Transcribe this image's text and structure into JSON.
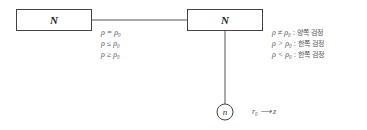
{
  "diagram": {
    "nodes": {
      "left_box": {
        "label": "N"
      },
      "right_box": {
        "label": "N"
      },
      "sample_circle": {
        "label": "n"
      }
    },
    "left_conditions": [
      {
        "text": "ρ = ρ₀"
      },
      {
        "text": "ρ ≤ ρ₀"
      },
      {
        "text": "ρ ≥ ρ₀"
      }
    ],
    "right_conditions": [
      {
        "hypothesis": "ρ ≠ ρ₀",
        "separator": " : ",
        "test": "양쪽 검정"
      },
      {
        "hypothesis": "ρ > ρ₀",
        "separator": " : ",
        "test": "한쪽 검정"
      },
      {
        "hypothesis": "ρ < ρ₀",
        "separator": " : ",
        "test": "한쪽 검정"
      }
    ],
    "transform": {
      "text": "r₀ ⟶ z"
    },
    "colors": {
      "line": "#555555",
      "border": "#444444",
      "text": "#555555"
    }
  }
}
